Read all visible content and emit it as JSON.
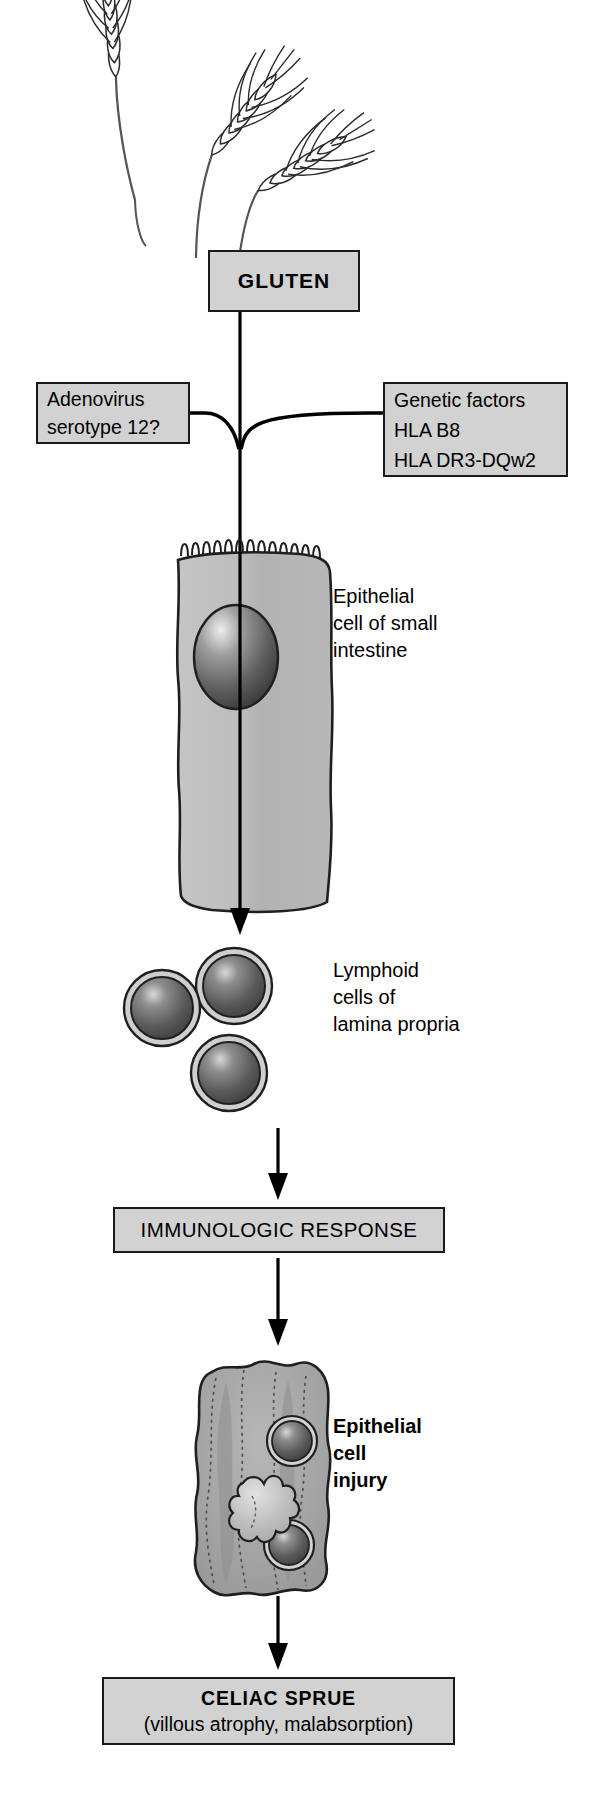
{
  "diagram": {
    "title_implicit": "Pathogenesis of celiac sprue",
    "colors": {
      "box_fill": "#d2d2d2",
      "box_border": "#1a1a1a",
      "cell_fill": "#b9b9b9",
      "nucleus_dark": "#4a4a4a",
      "text": "#000000"
    },
    "illustration": {
      "wheat_icon": "wheat-stalks-icon",
      "wheat_stalk_count": 3
    },
    "boxes": {
      "gluten": {
        "label": "GLUTEN"
      },
      "adenovirus": {
        "line1": "Adenovirus",
        "line2": "serotype 12?"
      },
      "genetic": {
        "line1": "Genetic factors",
        "line2": "HLA B8",
        "line3": "HLA DR3-DQw2"
      },
      "immunologic": {
        "label": "IMMUNOLOGIC RESPONSE"
      },
      "celiac": {
        "line1": "CELIAC SPRUE",
        "line2": "(villous atrophy, malabsorption)"
      }
    },
    "labels": {
      "epithelial_cell": "Epithelial\ncell of small\nintestine",
      "lymphoid_cells": "Lymphoid\ncells of\nlamina propria",
      "epithelial_injury": "Epithelial\ncell\ninjury"
    },
    "figures": {
      "epithelial_cell": {
        "name": "epithelial-cell-illustration",
        "features": "microvilli brush border, oval nucleus"
      },
      "lymphoid_cells": {
        "name": "lymphoid-cells-illustration",
        "count": 3
      },
      "injured_cell": {
        "name": "injured-epithelial-cell-illustration",
        "lymphocyte_count": 2,
        "features": "intraepithelial lymphocytes, damaged organelle, loss of microvilli"
      }
    },
    "flow_arrows": [
      {
        "from": "gluten",
        "to": "epithelial-cell"
      },
      {
        "from": "adenovirus",
        "to": "gluten-pathway"
      },
      {
        "from": "genetic",
        "to": "gluten-pathway"
      },
      {
        "from": "epithelial-cell",
        "to": "lymphoid-cells"
      },
      {
        "from": "lymphoid-cells",
        "to": "immunologic-response"
      },
      {
        "from": "immunologic-response",
        "to": "epithelial-cell-injury"
      },
      {
        "from": "epithelial-cell-injury",
        "to": "celiac-sprue"
      }
    ]
  }
}
